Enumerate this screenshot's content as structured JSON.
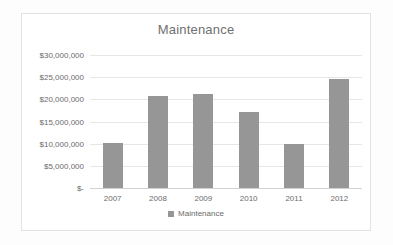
{
  "chart_data": {
    "type": "bar",
    "title": "Maintenance",
    "xlabel": "",
    "ylabel": "",
    "categories": [
      "2007",
      "2008",
      "2009",
      "2010",
      "2011",
      "2012"
    ],
    "values": [
      10200000,
      20800000,
      21200000,
      17200000,
      9900000,
      24500000
    ],
    "series": [
      {
        "name": "Maintenance",
        "values": [
          10200000,
          20800000,
          21200000,
          17200000,
          9900000,
          24500000
        ]
      }
    ],
    "ylim": [
      0,
      30000000
    ],
    "ytick_values": [
      30000000,
      25000000,
      20000000,
      15000000,
      10000000,
      5000000,
      0
    ],
    "ytick_labels": [
      "$30,000,000",
      "$25,000,000",
      "$20,000,000",
      "$15,000,000",
      "$10,000,000",
      "$5,000,000",
      "$-"
    ],
    "grid": true,
    "legend": {
      "position": "bottom",
      "entries": [
        {
          "label": "Maintenance",
          "color": "#969696",
          "marker": "legend-square-marker"
        }
      ]
    },
    "colors": {
      "bar": "#969696",
      "gridline": "#e6e6e6",
      "axis": "#d2d2d2",
      "text": "#6b6b6b",
      "title_text": "#6f6f6f",
      "frame_border": "#e2e2e2",
      "plot_background": "#ffffff"
    }
  }
}
